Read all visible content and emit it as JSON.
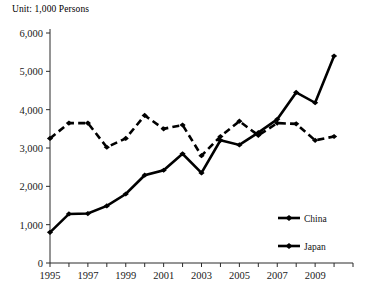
{
  "unit_label": "Unit: 1,000 Persons",
  "legend": {
    "position": "inside-bottom-right",
    "entries": [
      {
        "name": "China",
        "style": "solid"
      },
      {
        "name": "Japan",
        "style": "dashed"
      }
    ]
  },
  "axis": {
    "y_ticks": [
      "0",
      "1,000",
      "2,000",
      "3,000",
      "4,000",
      "5,000",
      "6,000"
    ],
    "x_ticks": [
      "1995",
      "1997",
      "1999",
      "2001",
      "2003",
      "2005",
      "2007",
      "2009"
    ]
  },
  "chart_data": {
    "type": "line",
    "title": "",
    "subtitle": "",
    "xlabel": "",
    "ylabel": "",
    "unit": "Unit: 1,000 Persons",
    "grid": false,
    "legend_position": "inside-bottom-right",
    "ylim": [
      0,
      6000
    ],
    "ytick_interval": 1000,
    "ytick_labels": [
      "0",
      "1,000",
      "2,000",
      "3,000",
      "4,000",
      "5,000",
      "6,000"
    ],
    "xlim": [
      1995,
      2011
    ],
    "xtick_labels_shown": [
      "1995",
      "1997",
      "1999",
      "2001",
      "2003",
      "2005",
      "2007",
      "2009"
    ],
    "x": [
      1995,
      1996,
      1997,
      1998,
      1999,
      2000,
      2001,
      2002,
      2003,
      2004,
      2005,
      2006,
      2007,
      2008,
      2009,
      2010
    ],
    "categories": [
      "1995",
      "1996",
      "1997",
      "1998",
      "1999",
      "2000",
      "2001",
      "2002",
      "2003",
      "2004",
      "2005",
      "2006",
      "2007",
      "2008",
      "2009",
      "2010"
    ],
    "series": [
      {
        "name": "China",
        "style": "solid",
        "color": "#000000",
        "values": [
          800,
          1280,
          1290,
          1490,
          1800,
          2290,
          2420,
          2850,
          2350,
          3200,
          3080,
          3400,
          3750,
          4450,
          4180,
          5400
        ]
      },
      {
        "name": "Japan",
        "style": "dashed",
        "color": "#000000",
        "values": [
          3250,
          3650,
          3650,
          3020,
          3250,
          3850,
          3500,
          3600,
          2800,
          3300,
          3700,
          3330,
          3650,
          3630,
          3200,
          3300
        ]
      }
    ]
  }
}
